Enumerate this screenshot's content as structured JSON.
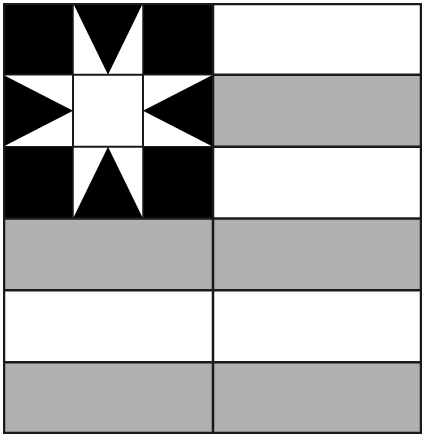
{
  "colors": {
    "canton": "#000000",
    "star": "#ffffff",
    "stripe_light": "#ffffff",
    "stripe_dark": "#b0b0b0",
    "line": "#1a1a1a"
  },
  "layout": {
    "width": 419,
    "height": 431,
    "divider_x": 210,
    "stripe_count": 6,
    "stripe_height": 71.83,
    "canton_cells": 3
  },
  "stripes": [
    {
      "index": 0,
      "shade": "light"
    },
    {
      "index": 1,
      "shade": "dark"
    },
    {
      "index": 2,
      "shade": "light"
    },
    {
      "index": 3,
      "shade": "dark"
    },
    {
      "index": 4,
      "shade": "light"
    },
    {
      "index": 5,
      "shade": "dark"
    }
  ],
  "canton": {
    "motif": "eight-point-star",
    "rows": 3,
    "cols": 3
  }
}
